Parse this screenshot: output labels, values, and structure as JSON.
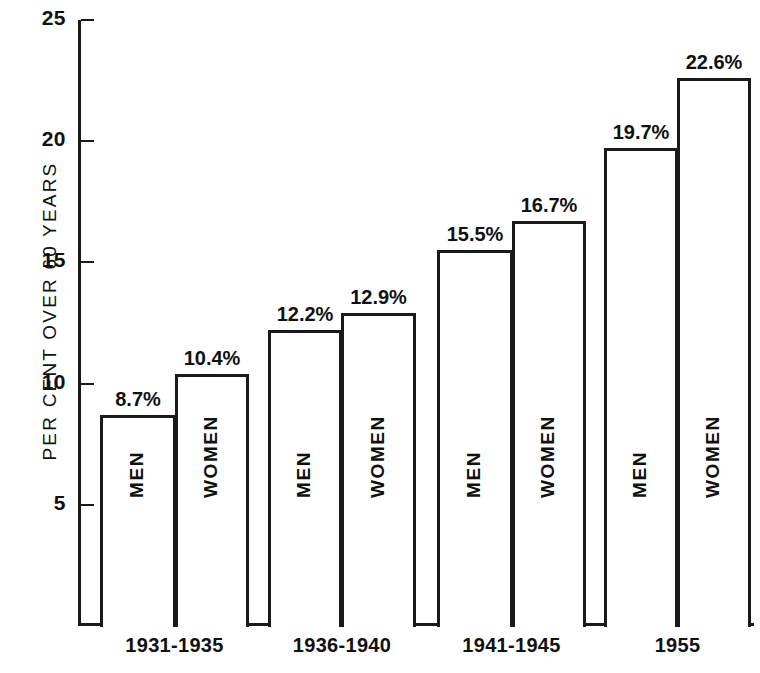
{
  "chart_data": {
    "type": "bar",
    "title": "",
    "xlabel": "",
    "ylabel": "PER CENT OVER 60 YEARS",
    "ylim": [
      0,
      25
    ],
    "yticks": [
      5,
      10,
      15,
      20,
      25
    ],
    "ytick_labels": [
      "5",
      "10",
      "15",
      "20",
      "25"
    ],
    "grid": false,
    "legend": "none",
    "categories": [
      "1931-1935",
      "1936-1940",
      "1941-1945",
      "1955"
    ],
    "series": [
      {
        "name": "MEN",
        "values": [
          8.7,
          12.2,
          15.5,
          19.7
        ]
      },
      {
        "name": "WOMEN",
        "values": [
          10.4,
          12.9,
          16.7,
          22.6
        ]
      }
    ],
    "data_labels": [
      [
        "8.7%",
        "10.4%"
      ],
      [
        "12.2%",
        "12.9%"
      ],
      [
        "15.5%",
        "16.7%"
      ],
      [
        "19.7%",
        "22.6%"
      ]
    ],
    "bars": [
      {
        "group": "1931-1935",
        "series": "MEN",
        "value": 8.7,
        "label": "8.7%",
        "x": 100,
        "width": 76
      },
      {
        "group": "1931-1935",
        "series": "WOMEN",
        "value": 10.4,
        "label": "10.4%",
        "x": 175,
        "width": 74
      },
      {
        "group": "1936-1940",
        "series": "MEN",
        "value": 12.2,
        "label": "12.2%",
        "x": 268,
        "width": 74
      },
      {
        "group": "1936-1940",
        "series": "WOMEN",
        "value": 12.9,
        "label": "12.9%",
        "x": 341,
        "width": 75
      },
      {
        "group": "1941-1945",
        "series": "MEN",
        "value": 15.5,
        "label": "15.5%",
        "x": 437,
        "width": 76
      },
      {
        "group": "1941-1945",
        "series": "WOMEN",
        "value": 16.7,
        "label": "16.7%",
        "x": 512,
        "width": 74
      },
      {
        "group": "1955",
        "series": "MEN",
        "value": 19.7,
        "label": "19.7%",
        "x": 604,
        "width": 74
      },
      {
        "group": "1955",
        "series": "WOMEN",
        "value": 22.6,
        "label": "22.6%",
        "x": 677,
        "width": 74
      }
    ],
    "colors": {
      "axis": "#1a1a1a",
      "bar_outline": "#1a1a1a",
      "bar_fill": "#ffffff",
      "text": "#111111",
      "background": "#ffffff"
    }
  }
}
